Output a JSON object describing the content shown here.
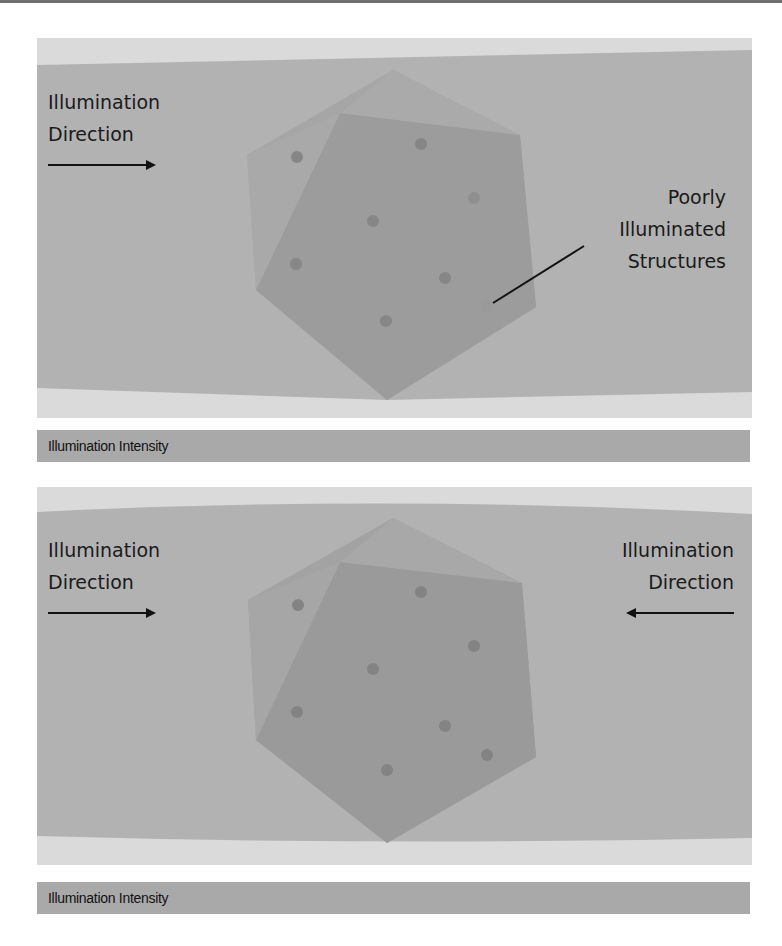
{
  "colors": {
    "background": "#ffffff",
    "panel_gray": "#b0b0b0",
    "panel_light": "#d9d9d9",
    "hex_outer": "#a3a3a3",
    "hex_inner": "#999999",
    "dot": "#858585",
    "bar": "#a9a9a9",
    "text": "#1a1a1a"
  },
  "panel_top": {
    "left_label": {
      "line1": "Illumination",
      "line2": "Direction",
      "arrow": "right-arrow"
    },
    "annotation": {
      "line1": "Poorly",
      "line2": "Illuminated",
      "line3": "Structures"
    },
    "intensity_bar_label": "Illumination Intensity"
  },
  "panel_bottom": {
    "left_label": {
      "line1": "Illumination",
      "line2": "Direction",
      "arrow": "right-arrow"
    },
    "right_label": {
      "line1": "Illumination",
      "line2": "Direction",
      "arrow": "left-arrow"
    },
    "intensity_bar_label": "Illumination Intensity"
  }
}
